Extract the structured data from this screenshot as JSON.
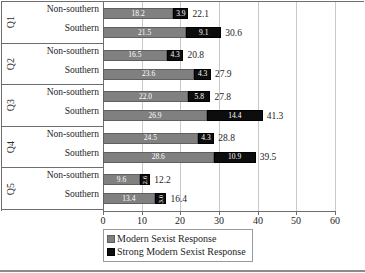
{
  "chart_data": {
    "type": "bar",
    "orientation": "horizontal",
    "stacked": true,
    "title": "",
    "xlabel": "",
    "ylabel": "",
    "xlim": [
      0,
      60
    ],
    "xticks": [
      0,
      10,
      20,
      30,
      40,
      50,
      60
    ],
    "xticklabels": [
      "0",
      "10",
      "20",
      "30",
      "40",
      "50",
      "60"
    ],
    "grid": true,
    "grid_axis": "x",
    "legend_position": "bottom-left",
    "colors": {
      "modern": "#808080",
      "strong": "#0d0d0d",
      "gridline": "#c9c9c9",
      "axis": "#6e6e6e",
      "value_label": "#ffffff",
      "total_label": "#1d1d1d"
    },
    "series": [
      {
        "name": "Modern Sexist Response",
        "key": "modern"
      },
      {
        "name": "Strong Modern Sexist Response",
        "key": "strong"
      }
    ],
    "groups": [
      {
        "group_label": "Q1",
        "rows": [
          {
            "label": "Non-southern",
            "modern": 18.2,
            "strong": 3.9,
            "total": 22.1,
            "modern_text": "18.2",
            "strong_text": "3.9",
            "total_text": "22.1",
            "strong_vertical": false
          },
          {
            "label": "Southern",
            "modern": 21.5,
            "strong": 9.1,
            "total": 30.6,
            "modern_text": "21.5",
            "strong_text": "9.1",
            "total_text": "30.6",
            "strong_vertical": false
          }
        ]
      },
      {
        "group_label": "Q2",
        "rows": [
          {
            "label": "Non-southern",
            "modern": 16.5,
            "strong": 4.3,
            "total": 20.8,
            "modern_text": "16.5",
            "strong_text": "4.3",
            "total_text": "20.8",
            "strong_vertical": false
          },
          {
            "label": "Southern",
            "modern": 23.6,
            "strong": 4.3,
            "total": 27.9,
            "modern_text": "23.6",
            "strong_text": "4.3",
            "total_text": "27.9",
            "strong_vertical": false
          }
        ]
      },
      {
        "group_label": "Q3",
        "rows": [
          {
            "label": "Non-southern",
            "modern": 22.0,
            "strong": 5.8,
            "total": 27.8,
            "modern_text": "22.0",
            "strong_text": "5.8",
            "total_text": "27.8",
            "strong_vertical": false
          },
          {
            "label": "Southern",
            "modern": 26.9,
            "strong": 14.4,
            "total": 41.3,
            "modern_text": "26.9",
            "strong_text": "14.4",
            "total_text": "41.3",
            "strong_vertical": false
          }
        ]
      },
      {
        "group_label": "Q4",
        "rows": [
          {
            "label": "Non-southern",
            "modern": 24.5,
            "strong": 4.3,
            "total": 28.8,
            "modern_text": "24.5",
            "strong_text": "4.3",
            "total_text": "28.8",
            "strong_vertical": false
          },
          {
            "label": "Southern",
            "modern": 28.6,
            "strong": 10.9,
            "total": 39.5,
            "modern_text": "28.6",
            "strong_text": "10.9",
            "total_text": "39.5",
            "strong_vertical": false
          }
        ]
      },
      {
        "group_label": "Q5",
        "rows": [
          {
            "label": "Non-southern",
            "modern": 9.6,
            "strong": 2.6,
            "total": 12.2,
            "modern_text": "9.6",
            "strong_text": "2.6",
            "total_text": "12.2",
            "strong_vertical": true
          },
          {
            "label": "Southern",
            "modern": 13.4,
            "strong": 3.0,
            "total": 16.4,
            "modern_text": "13.4",
            "strong_text": "3.0",
            "total_text": "16.4",
            "strong_vertical": true
          }
        ]
      }
    ]
  }
}
